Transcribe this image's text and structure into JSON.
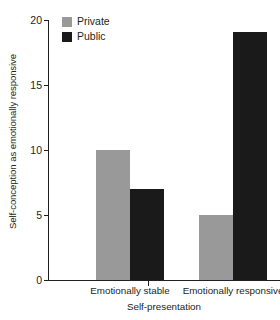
{
  "chart_data": {
    "type": "bar",
    "title": "",
    "subtitle": "",
    "categories": [
      "Emotionally stable",
      "Emotionally responsive"
    ],
    "series": [
      {
        "name": "Private",
        "color": "#999999",
        "values": [
          10,
          5
        ]
      },
      {
        "name": "Public",
        "color": "#1a1a1a",
        "values": [
          7,
          19.1
        ]
      }
    ],
    "xlabel": "Self-presentation",
    "ylabel": "Self-conception as emotionally responsive",
    "ylim": [
      0,
      20
    ],
    "ytick_values": [
      0,
      5,
      10,
      15,
      20
    ],
    "ytick_labels": [
      "0",
      "5",
      "10",
      "15",
      "20"
    ],
    "grid": false,
    "legend_position": "top-left-inside",
    "annotations": []
  },
  "legend": {
    "entries": [
      {
        "label": "Private",
        "swatch": "legend-swatch-private"
      },
      {
        "label": "Public",
        "swatch": "legend-swatch-public"
      }
    ]
  },
  "colors": {
    "private": "#999999",
    "public": "#1a1a1a",
    "axis": "#231f20",
    "background": "#ffffff"
  }
}
